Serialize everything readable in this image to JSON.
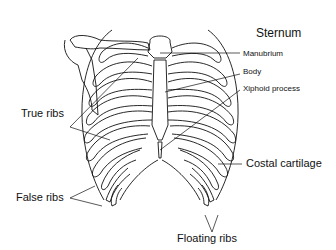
{
  "diagram": {
    "labels": {
      "sternum": "Sternum",
      "manubrium": "Manubrium",
      "body": "Body",
      "xiphoid": "Xiphoid process",
      "true_ribs": "True ribs",
      "costal_cartilage": "Costal cartilage",
      "false_ribs": "False ribs",
      "floating_ribs": "Floating ribs"
    },
    "colors": {
      "line": "#111111",
      "background": "#ffffff"
    }
  }
}
